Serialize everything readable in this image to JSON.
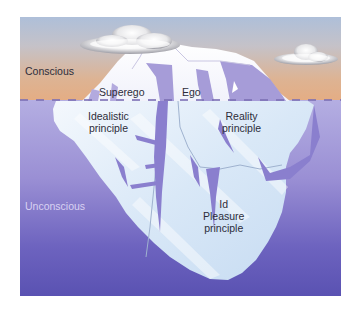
{
  "diagram": {
    "zones": {
      "conscious": "Conscious",
      "unconscious": "Unconscious"
    },
    "structures": [
      {
        "name": "Superego",
        "principle": "Idealistic principle"
      },
      {
        "name": "Ego",
        "principle": "Reality principle"
      },
      {
        "name": "Id",
        "principle": "Pleasure principle"
      }
    ],
    "labels": {
      "superego": "Superego",
      "ego": "Ego",
      "idealistic_line1": "Idealistic",
      "idealistic_line2": "principle",
      "reality_line1": "Reality",
      "reality_line2": "principle",
      "id": "Id",
      "pleasure_line1": "Pleasure",
      "pleasure_line2": "principle"
    },
    "colors": {
      "sky_top": "#aebfd9",
      "sky_bottom": "#e4ad84",
      "water_top": "#b4aee2",
      "water_bottom": "#5a52b2",
      "ice": "#eaf2fb",
      "ice_crevice": "#8a7fce"
    }
  }
}
